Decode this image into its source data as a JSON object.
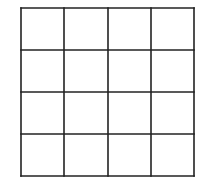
{
  "diagram": {
    "type": "grid",
    "rows": 4,
    "columns": 4,
    "line_color": "#222222",
    "background_color": "#ffffff",
    "line_width": 1.6,
    "vertical_lines_x": [
      21,
      64,
      108,
      151,
      194
    ],
    "horizontal_lines_y": [
      8,
      50,
      92,
      134,
      176
    ]
  }
}
